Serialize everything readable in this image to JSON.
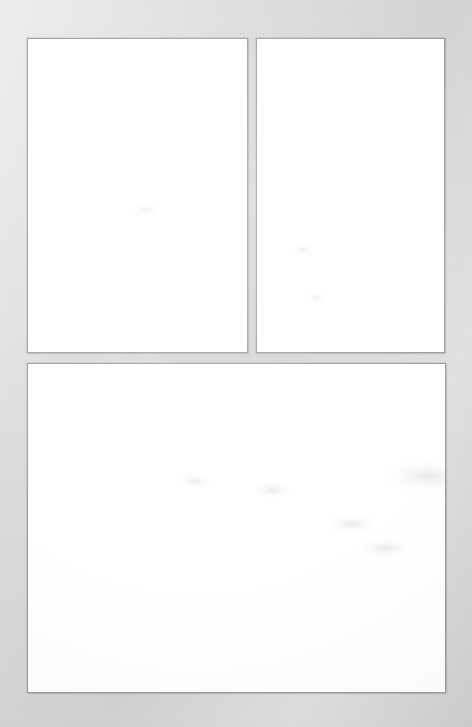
{
  "page": {
    "name": "scanned-document-page",
    "width": 472,
    "height": 727,
    "background_color": "#d8d8d8",
    "surface_description": "",
    "content_text": ""
  },
  "theme": {
    "page_background": "#d8d8d8",
    "panel_background": "#ffffff",
    "panel_border": "#9a9a9a",
    "ghost_mark": "#babac4"
  },
  "panels": [
    {
      "id": "panel-top-left",
      "name": "content-panel-top-left",
      "position": "top-left",
      "x": 27,
      "y": 38,
      "width": 221,
      "height": 315,
      "content": "",
      "state": "blank"
    },
    {
      "id": "panel-top-right",
      "name": "content-panel-top-right",
      "position": "top-right",
      "x": 256,
      "y": 38,
      "width": 189,
      "height": 315,
      "content": "",
      "state": "blank"
    },
    {
      "id": "panel-bottom",
      "name": "content-panel-bottom",
      "position": "bottom-full-width",
      "x": 27,
      "y": 363,
      "width": 419,
      "height": 330,
      "content": "",
      "state": "blank"
    }
  ],
  "ghost_marks": [
    {
      "panel": "panel-bottom",
      "x": 355,
      "y": 95,
      "w": 90,
      "h": 34
    },
    {
      "panel": "panel-bottom",
      "x": 415,
      "y": 135,
      "w": 70,
      "h": 28
    },
    {
      "panel": "panel-bottom",
      "x": 300,
      "y": 150,
      "w": 48,
      "h": 20
    },
    {
      "panel": "panel-bottom",
      "x": 225,
      "y": 118,
      "w": 40,
      "h": 16
    },
    {
      "panel": "panel-bottom",
      "x": 150,
      "y": 110,
      "w": 34,
      "h": 14
    },
    {
      "panel": "panel-bottom",
      "x": 330,
      "y": 175,
      "w": 56,
      "h": 18
    },
    {
      "panel": "panel-top-left",
      "x": 105,
      "y": 165,
      "w": 26,
      "h": 12
    },
    {
      "panel": "panel-top-right",
      "x": 35,
      "y": 205,
      "w": 22,
      "h": 11
    },
    {
      "panel": "panel-top-right",
      "x": 50,
      "y": 253,
      "w": 18,
      "h": 10
    }
  ]
}
